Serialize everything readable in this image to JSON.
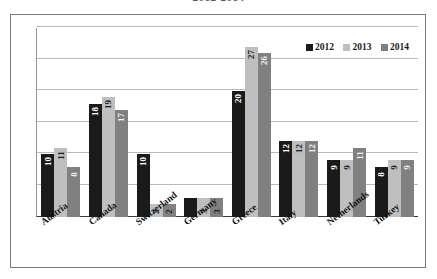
{
  "chart_title": "2012-2014",
  "legend": {
    "position": "top-right",
    "entries": [
      {
        "label": "2012",
        "color": "#1a1a1a"
      },
      {
        "label": "2013",
        "color": "#bfbfbf"
      },
      {
        "label": "2014",
        "color": "#808080"
      }
    ]
  },
  "chart_data": {
    "type": "bar",
    "title": "2012-2014",
    "xlabel": "",
    "ylabel": "",
    "ylim": [
      0,
      30
    ],
    "grid": true,
    "gridlines": [
      5,
      10,
      15,
      20,
      25,
      30
    ],
    "legend_position": "top-right",
    "categories": [
      "Austria",
      "Canada",
      "Switzerland",
      "Germany",
      "Greece",
      "Italy",
      "Netherlands",
      "Turkey"
    ],
    "series": [
      {
        "name": "2012",
        "color": "#1a1a1a",
        "values": [
          10,
          18,
          10,
          3,
          20,
          12,
          9,
          8
        ]
      },
      {
        "name": "2013",
        "color": "#bfbfbf",
        "values": [
          11,
          19,
          2,
          3,
          27,
          12,
          9,
          9
        ]
      },
      {
        "name": "2014",
        "color": "#808080",
        "values": [
          8,
          17,
          2,
          3,
          26,
          12,
          11,
          9
        ]
      }
    ]
  }
}
